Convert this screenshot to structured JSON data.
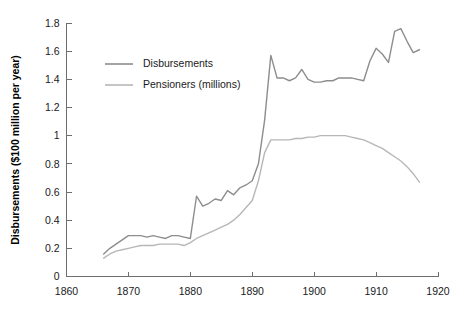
{
  "chart_data": {
    "type": "line",
    "title": "",
    "subtitle": "",
    "xlabel": "",
    "ylabel": "Disbursements ($100 million per year)",
    "xlim": [
      1860,
      1920
    ],
    "ylim": [
      0,
      1.8
    ],
    "grid": false,
    "legend_position": "top-left-inside",
    "x_ticks": [
      "1860",
      "1870",
      "1880",
      "1890",
      "1900",
      "1910",
      "1920"
    ],
    "x_tick_values": [
      1860,
      1870,
      1880,
      1890,
      1900,
      1910,
      1920
    ],
    "y_ticks": [
      "0",
      "0.2",
      "0.4",
      "0.6",
      "0.8",
      "1",
      "1.2",
      "1.4",
      "1.6",
      "1.8"
    ],
    "y_tick_values": [
      0,
      0.2,
      0.4,
      0.6,
      0.8,
      1,
      1.2,
      1.4,
      1.6,
      1.8
    ],
    "x": [
      1866,
      1867,
      1868,
      1869,
      1870,
      1871,
      1872,
      1873,
      1874,
      1875,
      1876,
      1877,
      1878,
      1879,
      1880,
      1881,
      1882,
      1883,
      1884,
      1885,
      1886,
      1887,
      1888,
      1889,
      1890,
      1891,
      1892,
      1893,
      1894,
      1895,
      1896,
      1897,
      1898,
      1899,
      1900,
      1901,
      1902,
      1903,
      1904,
      1905,
      1906,
      1907,
      1908,
      1909,
      1910,
      1911,
      1912,
      1913,
      1914,
      1915,
      1916,
      1917
    ],
    "series": [
      {
        "name": "Disbursements",
        "color": "#8d8d8d",
        "values": [
          0.16,
          0.2,
          0.23,
          0.26,
          0.29,
          0.29,
          0.29,
          0.28,
          0.29,
          0.28,
          0.27,
          0.29,
          0.29,
          0.28,
          0.27,
          0.57,
          0.5,
          0.52,
          0.55,
          0.54,
          0.61,
          0.58,
          0.63,
          0.65,
          0.68,
          0.8,
          1.11,
          1.57,
          1.41,
          1.41,
          1.39,
          1.41,
          1.47,
          1.4,
          1.38,
          1.38,
          1.39,
          1.39,
          1.41,
          1.41,
          1.41,
          1.4,
          1.39,
          1.53,
          1.62,
          1.58,
          1.52,
          1.74,
          1.76,
          1.67,
          1.59,
          1.61
        ]
      },
      {
        "name": "Pensioners (millions)",
        "color": "#b7b7b7",
        "values": [
          0.13,
          0.16,
          0.18,
          0.19,
          0.2,
          0.21,
          0.22,
          0.22,
          0.22,
          0.23,
          0.23,
          0.23,
          0.23,
          0.22,
          0.24,
          0.27,
          0.29,
          0.31,
          0.33,
          0.35,
          0.37,
          0.4,
          0.44,
          0.49,
          0.54,
          0.68,
          0.88,
          0.97,
          0.97,
          0.97,
          0.97,
          0.98,
          0.98,
          0.99,
          0.99,
          1.0,
          1.0,
          1.0,
          1.0,
          1.0,
          0.99,
          0.98,
          0.97,
          0.95,
          0.93,
          0.91,
          0.88,
          0.85,
          0.82,
          0.78,
          0.73,
          0.67
        ]
      }
    ],
    "legend": [
      {
        "label": "Disbursements",
        "color": "#8d8d8d"
      },
      {
        "label": "Pensioners (millions)",
        "color": "#b7b7b7"
      }
    ]
  }
}
